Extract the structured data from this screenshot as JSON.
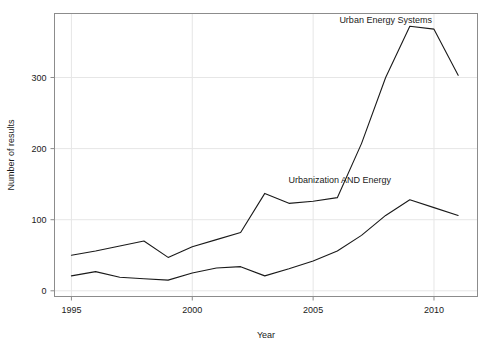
{
  "chart_data": {
    "type": "line",
    "title": "",
    "xlabel": "Year",
    "ylabel": "Number of results",
    "xlim": [
      1994.3,
      2011.8
    ],
    "ylim": [
      -8,
      390
    ],
    "xticks": [
      1995,
      2000,
      2005,
      2010
    ],
    "xtick_labels": [
      "1995",
      "2000",
      "2005",
      "2010"
    ],
    "yticks": [
      0,
      100,
      200,
      300
    ],
    "ytick_labels": [
      "0",
      "100",
      "200",
      "300"
    ],
    "grid": true,
    "legend_position": "inline-annotation",
    "x": [
      1995,
      1996,
      1997,
      1998,
      1999,
      2000,
      2001,
      2002,
      2003,
      2004,
      2005,
      2006,
      2007,
      2008,
      2009,
      2010,
      2011
    ],
    "series": [
      {
        "name": "Urban Energy Systems",
        "label_x": 2008.0,
        "label_y": 376,
        "values": [
          50,
          56,
          63,
          70,
          47,
          62,
          72,
          82,
          137,
          123,
          126,
          131,
          207,
          300,
          372,
          368,
          303
        ]
      },
      {
        "name": "Urbanization AND Energy",
        "label_x": 2006.1,
        "label_y": 152,
        "values": [
          21,
          27,
          19,
          17,
          15,
          25,
          32,
          34,
          21,
          31,
          42,
          56,
          78,
          106,
          128,
          117,
          106
        ]
      }
    ]
  },
  "labels": {
    "x_axis_title": "Year",
    "y_axis_title": "Number of results"
  }
}
